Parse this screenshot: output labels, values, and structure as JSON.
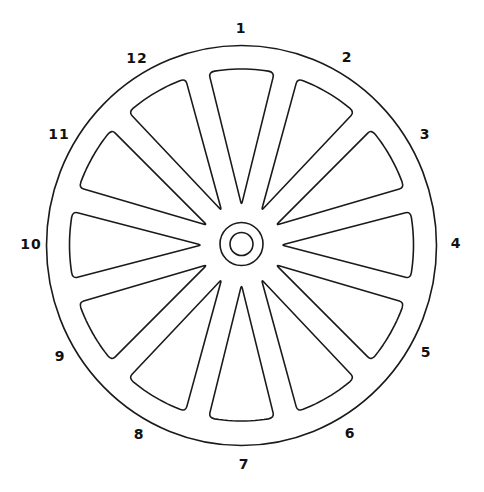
{
  "diagram": {
    "title": "",
    "line_color": "#1a1a1a",
    "background": "#ffffff",
    "spoke_count": 12,
    "labels": [
      {
        "text": "1",
        "x": 241,
        "y": 28
      },
      {
        "text": "2",
        "x": 347,
        "y": 57
      },
      {
        "text": "3",
        "x": 425,
        "y": 134
      },
      {
        "text": "4",
        "x": 456,
        "y": 243
      },
      {
        "text": "5",
        "x": 426,
        "y": 352
      },
      {
        "text": "6",
        "x": 350,
        "y": 433
      },
      {
        "text": "7",
        "x": 244,
        "y": 464
      },
      {
        "text": "8",
        "x": 139,
        "y": 434
      },
      {
        "text": "9",
        "x": 60,
        "y": 356
      },
      {
        "text": "10",
        "x": 31,
        "y": 244
      },
      {
        "text": "11",
        "x": 59,
        "y": 134
      },
      {
        "text": "12",
        "x": 137,
        "y": 58
      }
    ]
  }
}
